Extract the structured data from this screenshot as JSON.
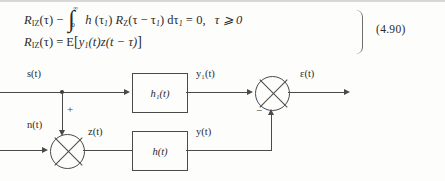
{
  "equation": {
    "line1": {
      "lhs_symbol": "R",
      "lhs_subscript": "IZ",
      "lhs_arg": "(τ)",
      "minus": "−",
      "integral_upper": "∞",
      "integral_lower": "0",
      "integrand_h": "h",
      "integrand_h_arg": "(τ",
      "integrand_h_sub": "1",
      "integrand_h_close": ")",
      "integrand_R": "R",
      "integrand_R_sub": "Z",
      "integrand_R_arg_open": "(τ",
      "integrand_R_minus": "−",
      "integrand_R_tau": "τ",
      "integrand_R_sub2": "1",
      "integrand_R_close": ")",
      "differential": "dτ",
      "differential_sub": "1",
      "equals": "= 0",
      "comma": ",",
      "condition": "τ ⩾ 0"
    },
    "line2": {
      "lhs_symbol": "R",
      "lhs_subscript": "IZ",
      "lhs_arg": "(τ)",
      "equals": "=",
      "operator": "E",
      "bracket_open": "[",
      "term_y": "y",
      "term_y_sub": "1",
      "term_y_arg": "(t)",
      "term_z": "z",
      "term_z_arg": "(t − τ)",
      "bracket_close": "]"
    },
    "number": "(4.90)"
  },
  "diagram": {
    "input_signal_label": "s(t)",
    "noise_label": "n(t)",
    "top_block_label": "h₁(t)",
    "bottom_block_label": "h(t)",
    "top_output_label": "y₁(t)",
    "bottom_output_label": "y(t)",
    "sum_output_label": "z(t)",
    "error_label": "ε(t)",
    "plus_sign": "+",
    "minus_sign": "−"
  }
}
